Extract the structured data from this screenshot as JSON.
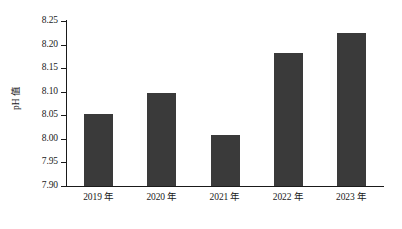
{
  "chart_data": {
    "type": "bar",
    "title": "",
    "subtitle": "",
    "xlabel": "",
    "ylabel": "pH 值",
    "categories": [
      "2019 年",
      "2020 年",
      "2021 年",
      "2022 年",
      "2023 年"
    ],
    "values": [
      8.053,
      8.097,
      8.008,
      8.183,
      8.225
    ],
    "ylim": [
      7.9,
      8.25
    ],
    "ytick_labels": [
      "7.90",
      "7.95",
      "8.00",
      "8.05",
      "8.10",
      "8.15",
      "8.20",
      "8.25"
    ],
    "ytick_values": [
      7.9,
      7.95,
      8.0,
      8.05,
      8.1,
      8.15,
      8.2,
      8.25
    ],
    "grid": false,
    "legend": null,
    "legend_position": "none",
    "bar_color": "#3a3a3a",
    "axis_color": "#1a1a1a",
    "background_color": "#ffffff"
  }
}
